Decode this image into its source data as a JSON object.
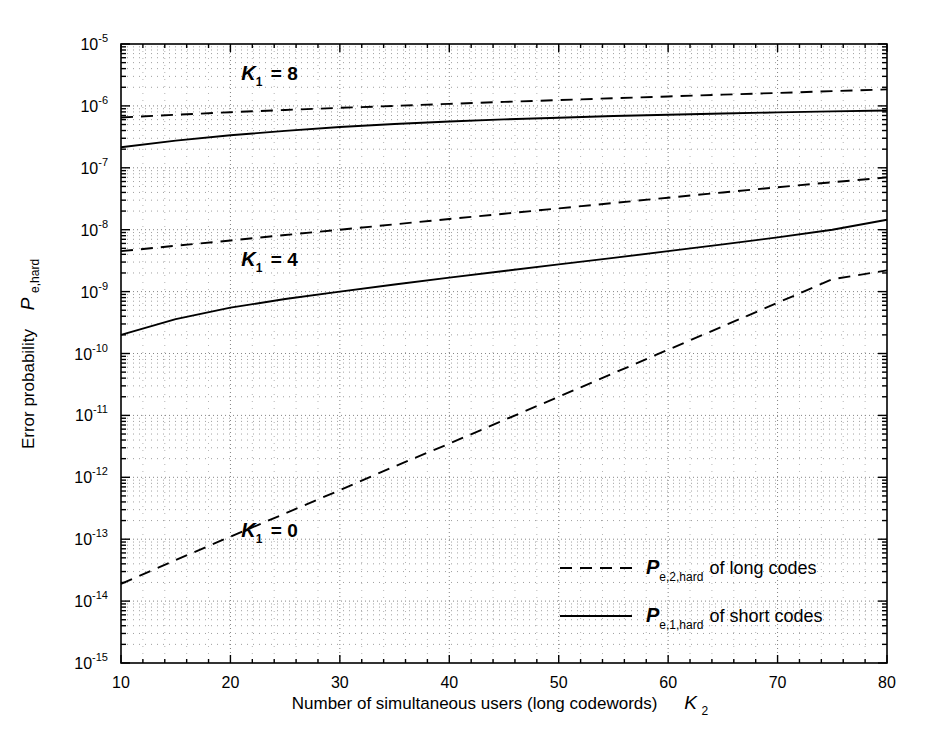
{
  "chart_data": {
    "type": "line",
    "title": "",
    "xlabel": "Number of simultaneous users  (long codewords)   K2",
    "xlabel_main": "Number of simultaneous users  (long codewords)",
    "xlabel_sym": "K",
    "xlabel_sym_sub": "2",
    "ylabel_main": "Error probability",
    "ylabel_sym": "P",
    "ylabel_sym_sub": "e,hard",
    "xlim": [
      10,
      80
    ],
    "ylim": [
      1e-15,
      1e-05
    ],
    "yscale": "log",
    "xscale": "linear",
    "grid": true,
    "grid_style": "dotted-minor-and-major",
    "legend_position": "lower right (inside axes)",
    "xticks": [
      10,
      20,
      30,
      40,
      50,
      60,
      70,
      80
    ],
    "xtick_labels": [
      "10",
      "20",
      "30",
      "40",
      "50",
      "60",
      "70",
      "80"
    ],
    "yticks": [
      1e-05,
      1e-06,
      1e-07,
      1e-08,
      1e-09,
      1e-10,
      1e-11,
      1e-12,
      1e-13,
      1e-14,
      1e-15
    ],
    "ytick_labels": [
      "10-5",
      "10-6",
      "10-7",
      "10-8",
      "10-9",
      "10-10",
      "10-11",
      "10-12",
      "10-13",
      "10-14",
      "10-15"
    ],
    "ytick_exponents": [
      "-5",
      "-6",
      "-7",
      "-8",
      "-9",
      "-10",
      "-11",
      "-12",
      "-13",
      "-14",
      "-15"
    ],
    "ytick_mantissa": "10",
    "series": [
      {
        "name": "Pe,2,hard long codes, K1 = 8",
        "style": "dashed",
        "group": "K1=8",
        "x": [
          10,
          15,
          20,
          25,
          30,
          35,
          40,
          45,
          50,
          55,
          60,
          65,
          70,
          75,
          80
        ],
        "y": [
          6.5e-07,
          7.2e-07,
          7.9e-07,
          8.6e-07,
          9.3e-07,
          1e-06,
          1.08e-06,
          1.16e-06,
          1.24e-06,
          1.33e-06,
          1.42e-06,
          1.52e-06,
          1.62e-06,
          1.73e-06,
          1.85e-06
        ]
      },
      {
        "name": "Pe,1,hard short codes, K1 = 8",
        "style": "solid",
        "group": "K1=8",
        "x": [
          10,
          15,
          20,
          25,
          30,
          35,
          40,
          45,
          50,
          55,
          60,
          65,
          70,
          75,
          80
        ],
        "y": [
          2.15e-07,
          2.75e-07,
          3.35e-07,
          3.95e-07,
          4.55e-07,
          5.1e-07,
          5.6e-07,
          6.05e-07,
          6.45e-07,
          6.85e-07,
          7.2e-07,
          7.55e-07,
          7.85e-07,
          8.15e-07,
          8.45e-07
        ]
      },
      {
        "name": "Pe,2,hard long codes, K1 = 4",
        "style": "dashed",
        "group": "K1=4",
        "x": [
          10,
          15,
          20,
          25,
          30,
          35,
          40,
          45,
          50,
          55,
          60,
          65,
          70,
          75,
          80
        ],
        "y": [
          4.5e-09,
          5.5e-09,
          6.7e-09,
          8.2e-09,
          1e-08,
          1.22e-08,
          1.49e-08,
          1.81e-08,
          2.21e-08,
          2.7e-08,
          3.29e-08,
          4e-08,
          4.85e-08,
          5.85e-08,
          7e-08
        ]
      },
      {
        "name": "Pe,1,hard short codes, K1 = 4",
        "style": "solid",
        "group": "K1=4",
        "x": [
          10,
          15,
          20,
          25,
          30,
          35,
          40,
          45,
          50,
          55,
          60,
          65,
          70,
          75,
          80
        ],
        "y": [
          2e-10,
          3.6e-10,
          5.5e-10,
          7.6e-10,
          1e-09,
          1.3e-09,
          1.68e-09,
          2.15e-09,
          2.75e-09,
          3.5e-09,
          4.5e-09,
          5.8e-09,
          7.5e-09,
          1e-08,
          1.45e-08
        ]
      },
      {
        "name": "Pe,2,hard long codes, K1 = 0",
        "style": "dashed",
        "group": "K1=0",
        "x": [
          10,
          15,
          20,
          25,
          30,
          35,
          40,
          45,
          50,
          55,
          60,
          65,
          70,
          75,
          80
        ],
        "y": [
          1.9e-14,
          4.6e-14,
          1.1e-13,
          2.6e-13,
          6.2e-13,
          1.5e-12,
          3.5e-12,
          8.4e-12,
          2e-11,
          4.8e-11,
          1.15e-10,
          2.75e-10,
          6.6e-10,
          1.58e-09,
          2.2e-09
        ]
      }
    ],
    "annotations": [
      {
        "id": "k1-8",
        "sym": "K",
        "sub": "1",
        "eq": "= 8",
        "x_data": 21,
        "y_data": 2.6e-06
      },
      {
        "id": "k1-4",
        "sym": "K",
        "sub": "1",
        "eq": "= 4",
        "x_data": 21,
        "y_data": 2.6e-09
      },
      {
        "id": "k1-0",
        "sym": "K",
        "sub": "1",
        "eq": "= 0",
        "x_data": 21,
        "y_data": 1.1e-13
      }
    ],
    "legend": [
      {
        "style": "dashed",
        "sym": "P",
        "sub": "e,2,hard",
        "text": "of long codes"
      },
      {
        "style": "solid",
        "sym": "P",
        "sub": "e,1,hard",
        "text": "of short codes"
      }
    ],
    "colors": {
      "line": "#000000",
      "grid": "#808080",
      "axis": "#000000",
      "background": "#ffffff"
    }
  }
}
